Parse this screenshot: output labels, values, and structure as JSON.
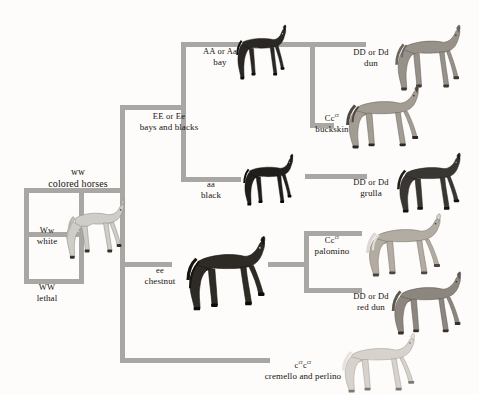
{
  "diagram": {
    "bar_color": "#a9a7a3",
    "background": "#fdfcfa"
  },
  "nodes": {
    "colored_horses": {
      "genotype": "ww",
      "phenotype": "colored horses"
    },
    "white": {
      "genotype": "Ww",
      "phenotype": "white"
    },
    "lethal": {
      "genotype": "WW",
      "phenotype": "lethal"
    },
    "bays_blacks": {
      "genotype": "EE or Ee",
      "phenotype": "bays and blacks"
    },
    "chestnut": {
      "genotype": "ee",
      "phenotype": "chestnut"
    },
    "bay": {
      "genotype": "AA or Aa",
      "phenotype": "bay"
    },
    "black": {
      "genotype": "aa",
      "phenotype": "black"
    },
    "dun": {
      "genotype": "DD or Dd",
      "phenotype": "dun"
    },
    "buckskin": {
      "genotype_pre": "Cc",
      "genotype_sup": "cr",
      "genotype_post": "",
      "phenotype": "buckskin"
    },
    "grulla": {
      "genotype": "DD or Dd",
      "phenotype": "grulla"
    },
    "palomino": {
      "genotype_pre": "Cc",
      "genotype_sup": "cr",
      "genotype_post": "",
      "phenotype": "palomino"
    },
    "red_dun": {
      "genotype": "DD or Dd",
      "phenotype": "red dun"
    },
    "cremello": {
      "genotype_pre": "c",
      "genotype_sup": "cr",
      "genotype_mid": "c",
      "genotype_sup2": "cr",
      "phenotype": "cremello and perlino"
    }
  },
  "horses": {
    "white": {
      "name": "white-horse",
      "coat": "#cfcdc8",
      "mane": "#b8b5af"
    },
    "bay": {
      "name": "bay-horse",
      "coat": "#2a2724",
      "mane": "#14120f"
    },
    "black": {
      "name": "black-horse",
      "coat": "#211e1b",
      "mane": "#0e0d0b"
    },
    "chestnut": {
      "name": "chestnut-horse",
      "coat": "#2e2a26",
      "mane": "#17140f"
    },
    "dun": {
      "name": "dun-horse",
      "coat": "#97918a",
      "mane": "#6b665f"
    },
    "buckskin": {
      "name": "buckskin-horse",
      "coat": "#a39c93",
      "mane": "#4d4941"
    },
    "grulla": {
      "name": "grulla-horse",
      "coat": "#3a3733",
      "mane": "#201e1b"
    },
    "palomino": {
      "name": "palomino-horse",
      "coat": "#b3aca2",
      "mane": "#ddd9d2"
    },
    "red_dun": {
      "name": "red-dun-horse",
      "coat": "#8d867e",
      "mane": "#5d5850"
    },
    "cremello": {
      "name": "cremello-horse",
      "coat": "#d7d3cc",
      "mane": "#e6e3dd"
    }
  }
}
